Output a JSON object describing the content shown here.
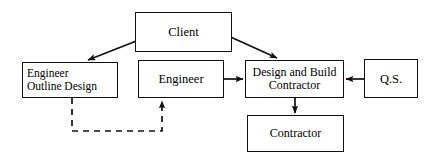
{
  "diagram": {
    "stroke_color": "#101010",
    "background_color": "#ffffff",
    "nodes": [
      {
        "id": "client",
        "label": "Client"
      },
      {
        "id": "engineer_outline_design",
        "label": "Engineer\nOutline Design"
      },
      {
        "id": "engineer",
        "label": "Engineer"
      },
      {
        "id": "design_build_contractor",
        "label": "Design and Build\nContractor"
      },
      {
        "id": "qs",
        "label": "Q.S."
      },
      {
        "id": "contractor",
        "label": "Contractor"
      }
    ],
    "connectors": [
      {
        "id": "client-to-engineer-outline-design",
        "from": "client",
        "to": "engineer_outline_design",
        "style": "solid",
        "arrow": "end"
      },
      {
        "id": "client-to-design-build-contractor",
        "from": "client",
        "to": "design_build_contractor",
        "style": "solid",
        "arrow": "end"
      },
      {
        "id": "engineer-to-design-build-contractor",
        "from": "engineer",
        "to": "design_build_contractor",
        "style": "solid",
        "arrow": "end"
      },
      {
        "id": "qs-to-design-build-contractor",
        "from": "qs",
        "to": "design_build_contractor",
        "style": "solid",
        "arrow": "end"
      },
      {
        "id": "design-build-contractor-to-contractor",
        "from": "design_build_contractor",
        "to": "contractor",
        "style": "solid",
        "arrow": "end"
      },
      {
        "id": "engineer-outline-design-to-engineer",
        "from": "engineer_outline_design",
        "to": "engineer",
        "style": "dashed",
        "arrow": "end"
      }
    ]
  }
}
